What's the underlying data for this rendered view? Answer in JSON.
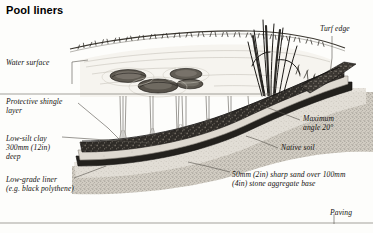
{
  "figure": {
    "title": "Pool liners",
    "kind": "cross-section illustration of a garden pool / pond construction"
  },
  "labels": {
    "water_surface": "Water surface",
    "protective_shingle": "Protective shingle\nlayer",
    "low_silt_clay": "Low-silt clay\n300mm (12in)\ndeep",
    "low_grade_liner": "Low-grade liner\n(e.g. black polythene)",
    "turf_edge": "Turf edge",
    "maximum_angle": "Maximum\nangle 20°",
    "native_soil": "Native soil",
    "sand_aggregate": "50mm (2in) sharp sand over 100mm\n(4in) stone aggregate base",
    "paving": "Paving"
  },
  "colors": {
    "page_background": "#fdfdfb",
    "ink": "#14120f",
    "shingle_band": "#2a2723",
    "liner_band": "#23211d",
    "clay_band": "#dcd8cf",
    "aggregate_fill": "#b9b4aa",
    "water_fill": "#f4f2ed",
    "leader_line": "#55524c"
  }
}
